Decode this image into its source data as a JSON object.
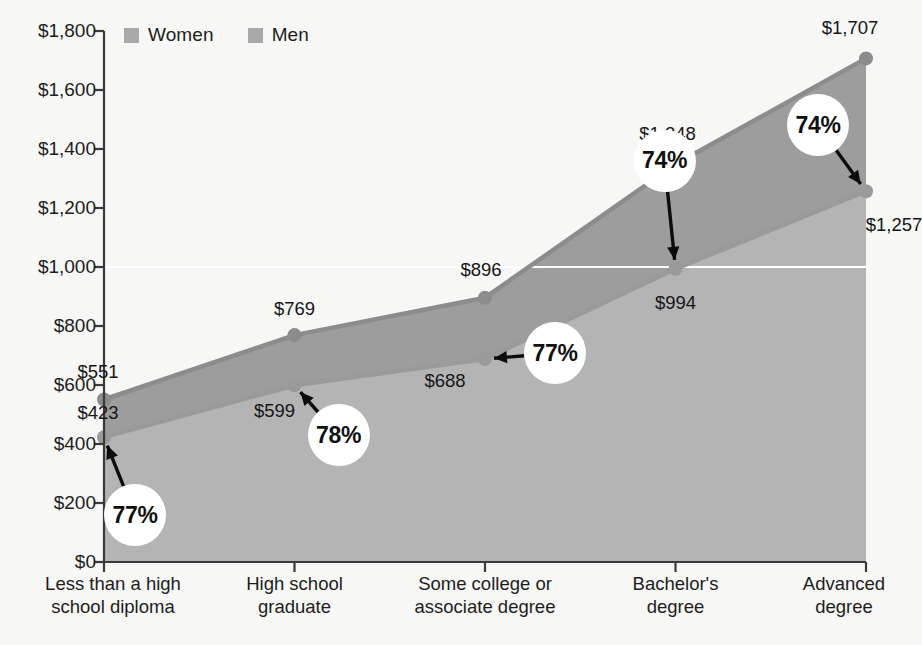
{
  "chart_data": {
    "type": "line",
    "title": "",
    "subtitle": "",
    "xlabel": "",
    "ylabel": "",
    "ylim": [
      0,
      1800
    ],
    "ytick_step": 200,
    "grid": "single white reference line at $1,000",
    "legend_position": "top-left inside plot",
    "categories": [
      "Less than a high\nschool diploma",
      "High school\ngraduate",
      "Some college or\nassociate degree",
      "Bachelor's\ndegree",
      "Advanced\ndegree"
    ],
    "series": [
      {
        "name": "Men",
        "color": "#9a9a9a",
        "values": [
          551,
          769,
          896,
          1348,
          1707
        ],
        "value_labels": [
          "$551",
          "$769",
          "$896",
          "$1,348",
          "$1,707"
        ]
      },
      {
        "name": "Women",
        "color": "#a8a8a8",
        "values": [
          423,
          599,
          688,
          994,
          1257
        ],
        "value_labels": [
          "$423",
          "$599",
          "$688",
          "$994",
          "$1,257"
        ]
      }
    ],
    "annotations": [
      {
        "label": "77%",
        "value": 77,
        "category_index": 0
      },
      {
        "label": "78%",
        "value": 78,
        "category_index": 1
      },
      {
        "label": "77%",
        "value": 77,
        "category_index": 2
      },
      {
        "label": "74%",
        "value": 74,
        "category_index": 3
      },
      {
        "label": "74%",
        "value": 74,
        "category_index": 4
      }
    ],
    "ytick_labels": [
      "$1,800",
      "$1,600",
      "$1,400",
      "$1,200",
      "$1,000",
      "$800",
      "$600",
      "$400",
      "$200",
      "$0"
    ],
    "ytick_values": [
      1800,
      1600,
      1400,
      1200,
      1000,
      800,
      600,
      400,
      200,
      0
    ]
  },
  "legend": {
    "items": [
      {
        "label": "Women",
        "color": "#a9a9a9"
      },
      {
        "label": "Men",
        "color": "#a9a9a9"
      }
    ]
  },
  "colors": {
    "background": "#f7f7f5",
    "band_upper": "#9d9d9d",
    "band_lower": "#b4b4b4",
    "line_men": "#8f8f8f",
    "line_women": "#9c9c9c",
    "axis": "#3a3a3a",
    "gridline": "#ffffff",
    "text": "#1d1d1d",
    "bubble_fill": "#ffffff"
  },
  "footnote": {
    "text": ""
  }
}
